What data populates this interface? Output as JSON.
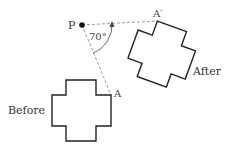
{
  "diagram": {
    "center": {
      "label": "P",
      "x": 82,
      "y": 25
    },
    "angle": {
      "label": "70°",
      "degrees": 70
    },
    "before": {
      "label": "Before",
      "vertex_label": "A"
    },
    "after": {
      "label": "After",
      "vertex_label": "A′"
    },
    "colors": {
      "shape": "#222222",
      "dashed": "#888888",
      "text": "#333333"
    }
  }
}
